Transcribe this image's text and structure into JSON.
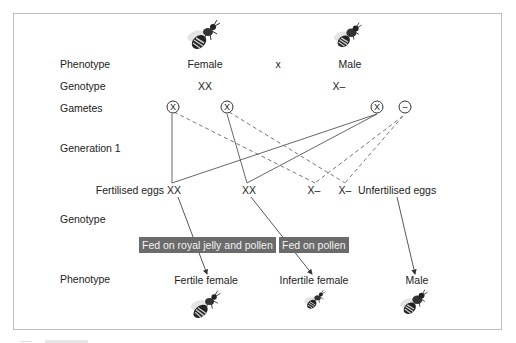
{
  "row_labels": {
    "phenotype_top": "Phenotype",
    "genotype_top": "Genotype",
    "gametes": "Gametes",
    "generation1": "Generation 1",
    "genotype_bottom": "Genotype",
    "phenotype_bottom": "Phenotype"
  },
  "parents": {
    "female": {
      "phenotype": "Female",
      "genotype": "XX",
      "icon": "bee-icon"
    },
    "cross_symbol": "x",
    "male": {
      "phenotype": "Male",
      "genotype": "X–",
      "icon": "bee-icon"
    }
  },
  "gametes": [
    {
      "symbol": "X",
      "parent": "female"
    },
    {
      "symbol": "X",
      "parent": "female"
    },
    {
      "symbol": "X",
      "parent": "male"
    },
    {
      "symbol": "–",
      "parent": "male"
    }
  ],
  "eggs": {
    "fertilised_label": "Fertilised eggs",
    "unfertilised_label": "Unfertilised eggs",
    "genotypes": [
      "XX",
      "XX",
      "X–",
      "X–"
    ]
  },
  "diets": {
    "royal_jelly": "Fed on royal jelly and pollen",
    "pollen": "Fed on pollen"
  },
  "offspring": [
    {
      "phenotype": "Fertile female",
      "icon": "bee-icon"
    },
    {
      "phenotype": "Infertile female",
      "icon": "bee-icon"
    },
    {
      "phenotype": "Male",
      "icon": "bee-icon"
    }
  ],
  "colors": {
    "line": "#444444",
    "tag_bg": "#6b6b6b",
    "tag_text": "#f2f2f2",
    "frame": "#bdbdbd"
  }
}
